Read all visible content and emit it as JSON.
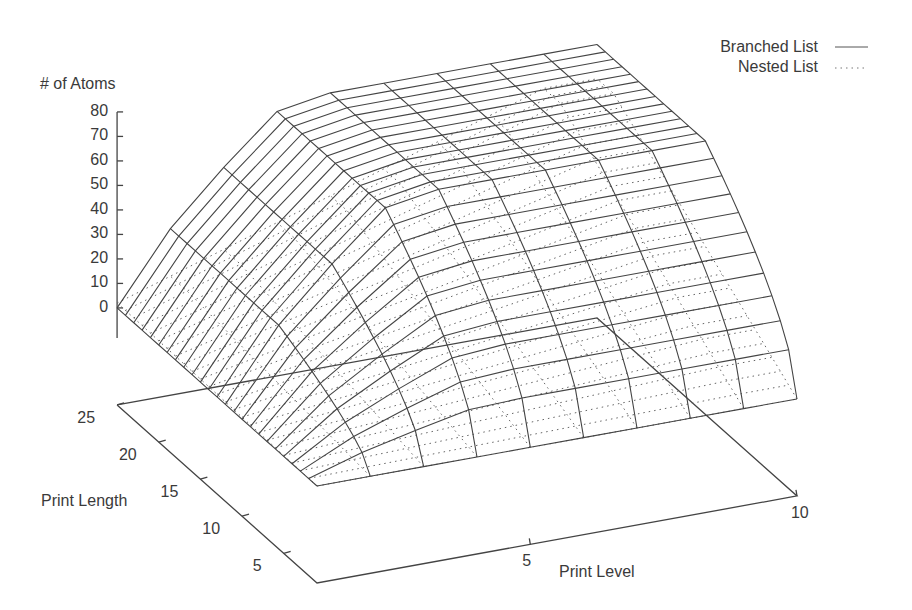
{
  "chart_data": {
    "type": "surface3d",
    "title": "",
    "zlabel": "# of Atoms",
    "xlabel": "Print Level",
    "ylabel": "Print Length",
    "zlim": [
      0,
      80
    ],
    "z_ticks": [
      "0",
      "10",
      "20",
      "30",
      "40",
      "50",
      "60",
      "70",
      "80"
    ],
    "x_ticks": [
      "5",
      "10"
    ],
    "y_ticks": [
      "5",
      "10",
      "15",
      "20",
      "25"
    ],
    "x_range": [
      1,
      10
    ],
    "y_range": [
      1,
      25
    ],
    "grid": false,
    "legend_position": "top-right",
    "series": [
      {
        "name": "Branched List",
        "style": "solid",
        "description": "Grows with print level and print length, saturating at a plateau of roughly 72 atoms for level >= 4 and length >= 12"
      },
      {
        "name": "Nested List",
        "style": "dotted",
        "description": "Grows roughly linearly with both print level and print length up to about 55 atoms, lying mostly below the branched surface"
      }
    ]
  },
  "labels": {
    "zlabel": "# of Atoms",
    "xlabel": "Print Level",
    "ylabel": "Print Length",
    "legend": [
      "Branched List",
      "Nested List"
    ]
  }
}
